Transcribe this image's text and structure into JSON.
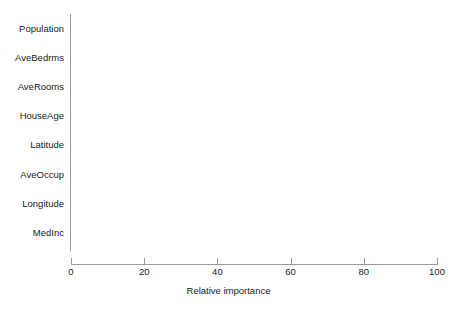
{
  "chart_data": {
    "type": "bar",
    "orientation": "horizontal",
    "title": "",
    "xlabel": "Relative importance",
    "ylabel": "",
    "categories": [
      "Population",
      "AveBedrms",
      "AveRooms",
      "HouseAge",
      "Latitude",
      "AveOccup",
      "Longitude",
      "MedInc"
    ],
    "values": [
      13.7,
      15.6,
      22.4,
      27.3,
      49.7,
      53.6,
      54.6,
      100.0
    ],
    "xlim": [
      0,
      100
    ],
    "xticks": [
      0,
      20,
      40,
      60,
      80,
      100
    ],
    "xticklabels": [
      "0",
      "20",
      "40",
      "60",
      "80",
      "100"
    ],
    "grid": false,
    "legend": null,
    "bar_color": "#2e2e2e",
    "background_color": "#ffffff",
    "axis_color": "#9a9a9a"
  }
}
